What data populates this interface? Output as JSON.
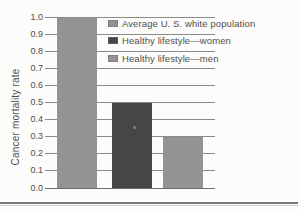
{
  "chart_data": {
    "type": "bar",
    "title": "",
    "xlabel": "",
    "ylabel": "Cancer mortality rate",
    "ylim": [
      0.0,
      1.0
    ],
    "ytick_interval": 0.1,
    "yticks": [
      "1.0",
      "0.9",
      "0.8",
      "0.7",
      "0.6",
      "0.5",
      "0.4",
      "0.3",
      "0.2",
      "0.1",
      "0.0"
    ],
    "grid": true,
    "legend_position": "upper-right-inside",
    "categories": [
      "Average U. S. white population",
      "Healthy lifestyle—women",
      "Healthy lifestyle—men"
    ],
    "values": [
      1.0,
      0.5,
      0.3
    ],
    "bars": [
      {
        "label": "Average U. S. white population",
        "value": 1.0,
        "color": "#939393"
      },
      {
        "label": "Healthy lifestyle—women",
        "value": 0.5,
        "color": "#464646"
      },
      {
        "label": "Healthy lifestyle—men",
        "value": 0.3,
        "color": "#939393"
      }
    ]
  },
  "colors": {
    "background": "#fcfcfa",
    "gridline": "#8a8a8a",
    "baseline": "#6f6f6f",
    "axis_text": "#4f4f4f",
    "legend_text": "#4f4f4f",
    "bar_gray": "#939393",
    "bar_dark": "#464646",
    "swatch_border": "#6e6e6e",
    "artifact_dot": "#9d9d9d",
    "divider_dark": "#7a7a7a",
    "divider_light": "#cfcfcf"
  }
}
